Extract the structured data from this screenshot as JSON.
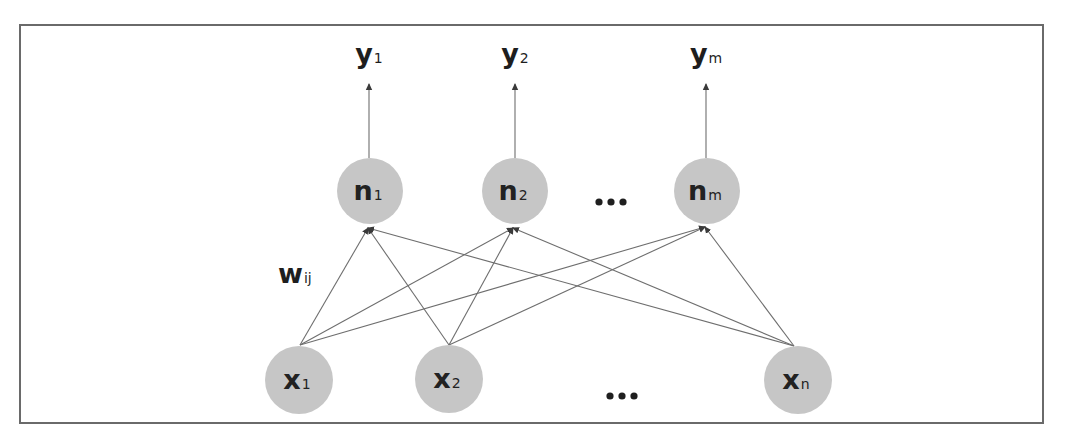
{
  "diagram": {
    "title": "",
    "frame": {
      "x": 20,
      "y": 25,
      "width": 1023,
      "height": 398,
      "stroke": "#6a6a6a"
    },
    "colors": {
      "node_fill": "#c6c6c6",
      "edge": "#6e6e6e",
      "text": "#222222"
    },
    "outputs": [
      {
        "id": "y1",
        "main": "y",
        "sub": "1",
        "x": 369,
        "label_y": 63
      },
      {
        "id": "y2",
        "main": "y",
        "sub": "2",
        "x": 515,
        "label_y": 63
      },
      {
        "id": "ym",
        "main": "y",
        "sub": "m",
        "x": 706,
        "label_y": 63
      }
    ],
    "hidden_nodes": [
      {
        "id": "n1",
        "main": "n",
        "sub": "1",
        "cx": 370,
        "cy": 191,
        "r": 33
      },
      {
        "id": "n2",
        "main": "n",
        "sub": "2",
        "cx": 515,
        "cy": 191,
        "r": 33
      },
      {
        "id": "nm",
        "main": "n",
        "sub": "m",
        "cx": 707,
        "cy": 191,
        "r": 33
      }
    ],
    "input_nodes": [
      {
        "id": "x1",
        "main": "x",
        "sub": "1",
        "cx": 299,
        "cy": 380,
        "r": 34
      },
      {
        "id": "x2",
        "main": "x",
        "sub": "2",
        "cx": 449,
        "cy": 379,
        "r": 34
      },
      {
        "id": "xn",
        "main": "x",
        "sub": "n",
        "cx": 798,
        "cy": 380,
        "r": 34
      }
    ],
    "weight_label": {
      "main": "w",
      "sub": "ij",
      "x": 278,
      "y": 283
    },
    "ellipsis": [
      {
        "id": "hidden-ellipsis",
        "text": "...",
        "dots": [
          [
            599,
            202
          ],
          [
            611,
            202
          ],
          [
            623,
            202
          ]
        ]
      },
      {
        "id": "input-ellipsis",
        "text": "...",
        "dots": [
          [
            610,
            396
          ],
          [
            622,
            396
          ],
          [
            634,
            396
          ]
        ]
      }
    ],
    "edges": [
      {
        "from": "x1",
        "to": "n1",
        "x1": 300,
        "y1": 345,
        "x2": 368,
        "y2": 228
      },
      {
        "from": "x1",
        "to": "n2",
        "x1": 300,
        "y1": 345,
        "x2": 513,
        "y2": 228
      },
      {
        "from": "x1",
        "to": "nm",
        "x1": 300,
        "y1": 345,
        "x2": 705,
        "y2": 227
      },
      {
        "from": "x2",
        "to": "n1",
        "x1": 449,
        "y1": 345,
        "x2": 368,
        "y2": 228
      },
      {
        "from": "x2",
        "to": "n2",
        "x1": 449,
        "y1": 345,
        "x2": 513,
        "y2": 228
      },
      {
        "from": "x2",
        "to": "nm",
        "x1": 449,
        "y1": 345,
        "x2": 705,
        "y2": 227
      },
      {
        "from": "xn",
        "to": "n1",
        "x1": 794,
        "y1": 346,
        "x2": 368,
        "y2": 228
      },
      {
        "from": "xn",
        "to": "n2",
        "x1": 794,
        "y1": 346,
        "x2": 513,
        "y2": 228
      },
      {
        "from": "xn",
        "to": "nm",
        "x1": 794,
        "y1": 346,
        "x2": 705,
        "y2": 227
      }
    ],
    "output_edges": [
      {
        "from": "n1",
        "to": "y1",
        "x1": 369,
        "y1": 158,
        "x2": 369,
        "y2": 84
      },
      {
        "from": "n2",
        "to": "y2",
        "x1": 515,
        "y1": 158,
        "x2": 515,
        "y2": 84
      },
      {
        "from": "nm",
        "to": "ym",
        "x1": 706,
        "y1": 158,
        "x2": 706,
        "y2": 84
      }
    ]
  }
}
